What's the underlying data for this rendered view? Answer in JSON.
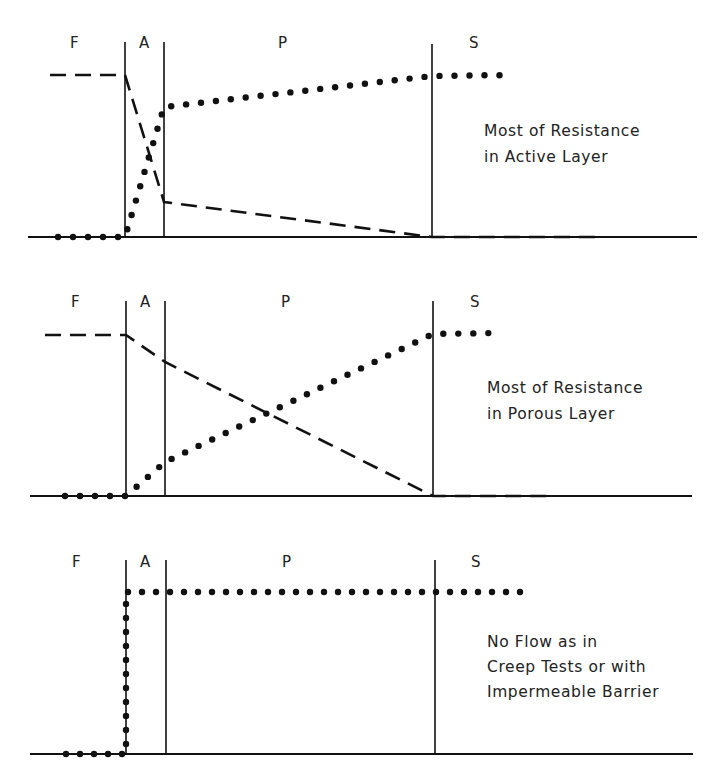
{
  "figure": {
    "region_labels": [
      "F",
      "A",
      "P",
      "S"
    ],
    "legend": {
      "dashed_line": "pressure profile",
      "dotted_line": "concentration/flow profile"
    },
    "panels": [
      {
        "id": "active-layer",
        "annotation": [
          "Most of Resistance",
          "in Active Layer"
        ],
        "baseline_y": 237,
        "boundaries_x": {
          "F_A": 125,
          "A_P": 164,
          "P_S": 432
        },
        "top_y": 42,
        "label_positions": {
          "F": [
            75,
            48
          ],
          "A": [
            145,
            48
          ],
          "P": [
            283,
            48
          ],
          "S": [
            474,
            48
          ]
        },
        "dashed": [
          [
            50,
            75
          ],
          [
            125,
            75
          ],
          [
            164,
            202
          ],
          [
            432,
            237
          ],
          [
            600,
            237
          ]
        ],
        "dotted": [
          [
            58,
            237
          ],
          [
            125,
            237
          ],
          [
            164,
            107
          ],
          [
            432,
            76
          ],
          [
            512,
            75
          ]
        ],
        "annotation_pos": [
          484,
          135
        ]
      },
      {
        "id": "porous-layer",
        "annotation": [
          "Most of Resistance",
          "in Porous Layer"
        ],
        "baseline_y": 496,
        "boundaries_x": {
          "F_A": 126,
          "A_P": 165,
          "P_S": 433
        },
        "top_y": 301,
        "label_positions": {
          "F": [
            76,
            307
          ],
          "A": [
            146,
            307
          ],
          "P": [
            286,
            307
          ],
          "S": [
            475,
            307
          ]
        },
        "dashed": [
          [
            45,
            335
          ],
          [
            126,
            335
          ],
          [
            165,
            362
          ],
          [
            433,
            496
          ],
          [
            555,
            496
          ]
        ],
        "dotted": [
          [
            65,
            496
          ],
          [
            126,
            496
          ],
          [
            165,
            462
          ],
          [
            433,
            334
          ],
          [
            498,
            333
          ]
        ],
        "annotation_pos": [
          487,
          392
        ]
      },
      {
        "id": "no-flow",
        "annotation": [
          "No Flow as in",
          "Creep Tests or with",
          "Impermeable Barrier"
        ],
        "baseline_y": 754,
        "boundaries_x": {
          "F_A": 126,
          "A_P": 166,
          "P_S": 435
        },
        "top_y": 560,
        "label_positions": {
          "F": [
            77,
            567
          ],
          "A": [
            146,
            567
          ],
          "P": [
            287,
            567
          ],
          "S": [
            476,
            567
          ]
        },
        "dashed": [],
        "dotted": [
          [
            66,
            754
          ],
          [
            126,
            754
          ],
          [
            126,
            592
          ],
          [
            520,
            592
          ]
        ],
        "annotation_pos": [
          487,
          646
        ]
      }
    ]
  }
}
